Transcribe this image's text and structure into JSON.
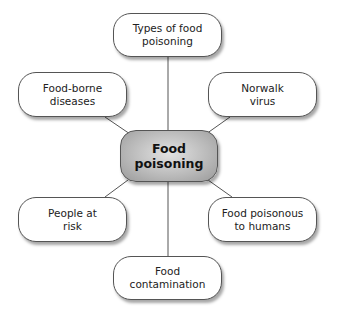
{
  "diagram": {
    "type": "mind-map",
    "center": {
      "label": "Food\npoisoning",
      "line1": "Food",
      "line2": "poisoning"
    },
    "nodes": [
      {
        "id": "top",
        "line1": "Types of food",
        "line2": "poisoning"
      },
      {
        "id": "upper-left",
        "line1": "Food-borne",
        "line2": "diseases"
      },
      {
        "id": "upper-right",
        "line1": "Norwalk",
        "line2": "virus"
      },
      {
        "id": "lower-left",
        "line1": "People at",
        "line2": "risk"
      },
      {
        "id": "lower-right",
        "line1": "Food poisonous",
        "line2": "to humans"
      },
      {
        "id": "bottom",
        "line1": "Food",
        "line2": "contamination"
      }
    ],
    "colors": {
      "center_fill": "#b8b8b8",
      "node_fill": "#ffffff",
      "line": "#555555"
    }
  }
}
